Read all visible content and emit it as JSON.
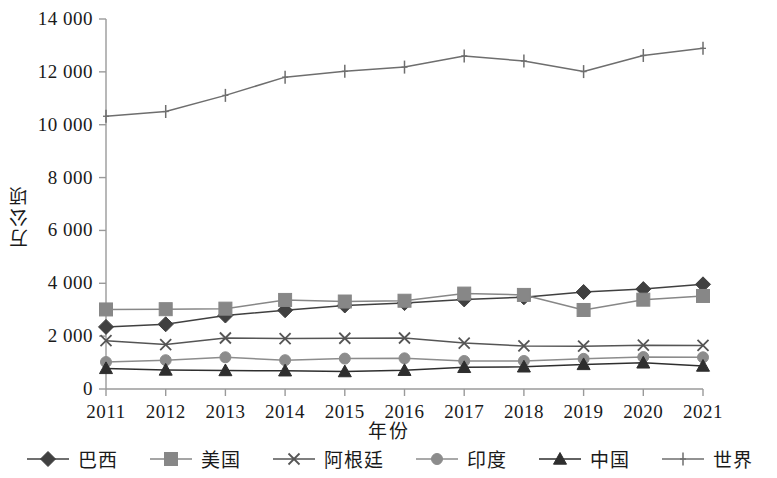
{
  "chart_data": {
    "type": "line",
    "title": "",
    "xlabel": "年份",
    "ylabel": "万公顷",
    "categories": [
      "2011",
      "2012",
      "2013",
      "2014",
      "2015",
      "2016",
      "2017",
      "2018",
      "2019",
      "2020",
      "2021"
    ],
    "x": [
      2011,
      2012,
      2013,
      2014,
      2015,
      2016,
      2017,
      2018,
      2019,
      2020,
      2021
    ],
    "ylim": [
      0,
      14000
    ],
    "xlim": [
      2011,
      2021
    ],
    "y_ticks": [
      "0",
      "2 000",
      "4 000",
      "6 000",
      "8 000",
      "10 000",
      "12 000",
      "14 000"
    ],
    "y_tick_values": [
      0,
      2000,
      4000,
      6000,
      8000,
      10000,
      12000,
      14000
    ],
    "grid": false,
    "legend_position": "bottom",
    "series": [
      {
        "name": "巴西",
        "marker": "diamond",
        "color": "#404040",
        "values": [
          2350,
          2450,
          2780,
          2980,
          3160,
          3250,
          3390,
          3470,
          3670,
          3780,
          3960
        ]
      },
      {
        "name": "美国",
        "marker": "square",
        "color": "#878787",
        "values": [
          3010,
          3020,
          3040,
          3370,
          3310,
          3340,
          3610,
          3560,
          2990,
          3380,
          3520
        ]
      },
      {
        "name": "阿根廷",
        "marker": "x",
        "color": "#555555",
        "values": [
          1830,
          1680,
          1930,
          1910,
          1920,
          1930,
          1740,
          1630,
          1620,
          1660,
          1650
        ]
      },
      {
        "name": "印度",
        "marker": "circle",
        "color": "#8c8c8c",
        "values": [
          1020,
          1090,
          1200,
          1090,
          1150,
          1160,
          1060,
          1060,
          1140,
          1210,
          1200
        ]
      },
      {
        "name": "中国",
        "marker": "triangle",
        "color": "#2e2e2e",
        "values": [
          780,
          720,
          700,
          690,
          660,
          710,
          820,
          840,
          930,
          990,
          870
        ]
      },
      {
        "name": "世界",
        "marker": "plus",
        "color": "#6e6e6e",
        "values": [
          10320,
          10500,
          11110,
          11800,
          12020,
          12180,
          12600,
          12410,
          12010,
          12620,
          12890
        ]
      }
    ]
  },
  "legend": {
    "items": [
      {
        "label": "巴西"
      },
      {
        "label": "美国"
      },
      {
        "label": "阿根廷"
      },
      {
        "label": "印度"
      },
      {
        "label": "中国"
      },
      {
        "label": "世界"
      }
    ]
  }
}
